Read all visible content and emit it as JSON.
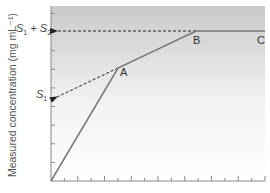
{
  "chart_data": {
    "type": "line",
    "title": "",
    "xlabel": "",
    "ylabel": "Measured concentration (mg mL⁻¹)",
    "grid": false,
    "points": [
      {
        "label": "",
        "x": 0,
        "y": 0
      },
      {
        "label": "A",
        "x": 4,
        "y": 6.4
      },
      {
        "label": "B",
        "x": 8.4,
        "y": 8.5
      },
      {
        "label": "C",
        "x": 12.2,
        "y": 8.5
      }
    ],
    "series": [
      {
        "name": "measured",
        "x": [
          0,
          4,
          8.4,
          12.2
        ],
        "y": [
          0,
          6.4,
          8.5,
          8.5
        ]
      }
    ],
    "annotations": [
      {
        "text": "S1 + S2",
        "type": "dashed-arrow",
        "from": "B",
        "to": "y-axis",
        "y": 8.5
      },
      {
        "text": "S1",
        "type": "dashed-arrow",
        "from": "A",
        "to": "y-axis",
        "y": 4.7
      }
    ],
    "x_ticks": 16,
    "y_ticks": 9,
    "xlim": [
      0,
      12.2
    ],
    "ylim": [
      0,
      10
    ]
  },
  "labels": {
    "ylabel": "Measured concentration (mg mL⁻¹)",
    "s_sum_main": "S",
    "s_sum_sub1": "1",
    "s_sum_plus": " + S",
    "s_sum_sub2": "2",
    "s1_main": "S",
    "s1_sub": "1",
    "point_a": "A",
    "point_b": "B",
    "point_c": "C"
  }
}
